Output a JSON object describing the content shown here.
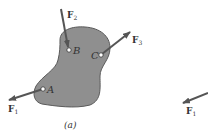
{
  "figure": {
    "caption": "(a)",
    "body_color": "#8c8c8c",
    "arrow_color": "#555555",
    "points": [
      {
        "label": "A",
        "x": 43,
        "y": 89
      },
      {
        "label": "B",
        "x": 69,
        "y": 50
      },
      {
        "label": "C",
        "x": 101,
        "y": 55
      }
    ],
    "forces": [
      {
        "name": "F",
        "sub": "1"
      },
      {
        "name": "F",
        "sub": "2"
      },
      {
        "name": "F",
        "sub": "3"
      }
    ]
  },
  "partial_figure": {
    "force": {
      "name": "F",
      "sub": "1"
    }
  }
}
